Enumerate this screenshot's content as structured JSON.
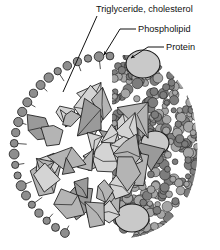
{
  "figure": {
    "background_color": "#ffffff"
  },
  "labels": [
    {
      "id": "triglyceride-cholesterol",
      "text": "Triglyceride, cholesterol",
      "x": 96,
      "y": 12,
      "anchor": "start",
      "leader": "M 97 16 L 63 92",
      "arrow": false
    },
    {
      "id": "phospholipid",
      "text": "Phospholipid",
      "x": 138,
      "y": 32,
      "anchor": "start",
      "leader": "M 136 29 L 120 29 L 104 55",
      "arrow": true
    },
    {
      "id": "protein",
      "text": "Protein",
      "x": 166,
      "y": 50,
      "anchor": "start",
      "leader": "M 164 47 L 148 47 L 131 58",
      "arrow": true
    }
  ],
  "colors": {
    "outline": "#1a1a1a",
    "phospholipid_head": "#8e8e8e",
    "surface_bead_light": "#a6a6a6",
    "surface_bead_dark": "#7d7d7d",
    "protein_fill": "#c9c9c9",
    "crystal_fill_light": "#d4d4d4",
    "crystal_fill_mid": "#b4b4b4",
    "crystal_fill_dark": "#9a9a9a",
    "core_void": "#ffffff",
    "label_text": "#111111"
  },
  "structure": {
    "particle_center_x": 110,
    "particle_center_y": 150,
    "particle_radius_x": 96,
    "particle_radius_y": 94,
    "cut_plane_x": 112,
    "monolayer_bead_count": 46,
    "protein_ovals": 3,
    "core_crystal_count": 44,
    "surface_bead_count": 430
  },
  "legend_note": "Left half: cross-section through phospholipid monolayer and lipid core. Right half: intact outer surface."
}
